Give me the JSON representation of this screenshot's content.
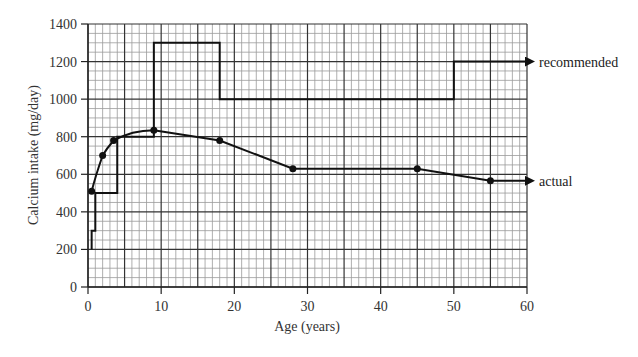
{
  "chart_data": {
    "type": "line",
    "title": "",
    "xlabel": "Age (years)",
    "ylabel": "Calcium intake (mg/day)",
    "xlim": [
      0,
      60
    ],
    "ylim": [
      0,
      1400
    ],
    "xticks": [
      0,
      10,
      20,
      30,
      40,
      50,
      60
    ],
    "yticks": [
      0,
      200,
      400,
      600,
      800,
      1000,
      1200,
      1400
    ],
    "grid": true,
    "grid_minor": {
      "x_step": 1,
      "y_step": 50
    },
    "grid_major": {
      "x_step": 5,
      "y_step": 200
    },
    "legend": "inline labels at right end of each series",
    "series": [
      {
        "name": "recommended",
        "style": "step",
        "markers": false,
        "arrow_end": true,
        "points": [
          [
            0.5,
            200
          ],
          [
            0.5,
            300
          ],
          [
            1,
            300
          ],
          [
            1,
            500
          ],
          [
            4,
            500
          ],
          [
            4,
            800
          ],
          [
            9,
            800
          ],
          [
            9,
            1300
          ],
          [
            18,
            1300
          ],
          [
            18,
            1000
          ],
          [
            50,
            1000
          ],
          [
            50,
            1200
          ],
          [
            60,
            1200
          ]
        ]
      },
      {
        "name": "actual",
        "style": "line",
        "markers": true,
        "arrow_end": true,
        "points": [
          [
            0.5,
            510
          ],
          [
            2,
            700
          ],
          [
            3.5,
            780
          ],
          [
            9,
            835
          ],
          [
            18,
            780
          ],
          [
            28,
            630
          ],
          [
            45,
            630
          ],
          [
            55,
            565
          ]
        ],
        "end": [
          60,
          565
        ]
      }
    ]
  }
}
